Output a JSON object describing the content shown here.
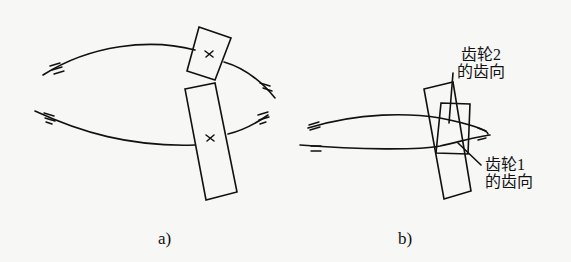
{
  "figure": {
    "panels": [
      {
        "id": "a",
        "caption": "a)"
      },
      {
        "id": "b",
        "caption": "b)"
      }
    ],
    "labels": {
      "gear2_line1": "齿轮2",
      "gear2_line2": "的齿向",
      "gear1_line1": "齿轮1",
      "gear1_line2": "的齿向"
    },
    "markers": {
      "center_mark": "×",
      "bearing_symbol": "="
    },
    "colors": {
      "line": "#111111",
      "background": "#f7f7f5"
    }
  }
}
